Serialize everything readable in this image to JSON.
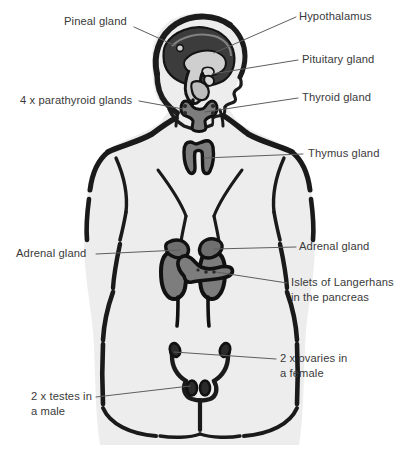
{
  "diagram": {
    "figure_description": "Grey silhouette of a human torso seen from behind with the head in right-facing profile; endocrine glands are drawn in mid-grey with heavy black outlines and connected to labels by thin leader lines.",
    "colors": {
      "background": "#ffffff",
      "body_fill": "#ededed",
      "body_outline": "#1a1a1a",
      "organ_fill": "#7d7d7d",
      "organ_outline": "#111111",
      "brain_fill": "#3c3c3c",
      "skull_outline": "#1c1c1c",
      "label_text": "#3a3a3a",
      "leader_line": "#5e5e5e"
    },
    "labels": [
      {
        "id": "pineal-gland",
        "text": "Pineal gland",
        "side": "left",
        "x": 64,
        "y": 19,
        "align": "left",
        "leader": [
          [
            134,
            27
          ],
          [
            176,
            44
          ]
        ]
      },
      {
        "id": "hypothalamus",
        "text": "Hypothalamus",
        "side": "right",
        "x": 300,
        "y": 9,
        "align": "left",
        "leader": [
          [
            296,
            17
          ],
          [
            215,
            52
          ]
        ]
      },
      {
        "id": "pituitary-gland",
        "text": "Pituitary gland",
        "side": "right",
        "x": 303,
        "y": 53,
        "align": "left",
        "leader": [
          [
            298,
            60
          ],
          [
            213,
            73
          ]
        ]
      },
      {
        "id": "thyroid-gland",
        "text": "Thyroid gland",
        "side": "right",
        "x": 303,
        "y": 91,
        "align": "left",
        "leader": [
          [
            298,
            98
          ],
          [
            202,
            114
          ]
        ]
      },
      {
        "id": "parathyroid-glands",
        "text": "4 x parathyroid glands",
        "side": "left",
        "x": 21,
        "y": 94,
        "align": "left",
        "leader": [
          [
            139,
            101
          ],
          [
            184,
            110
          ]
        ]
      },
      {
        "id": "thymus-gland",
        "text": "Thymus gland",
        "side": "right",
        "x": 308,
        "y": 147,
        "align": "left",
        "leader": [
          [
            303,
            154
          ],
          [
            200,
            157
          ]
        ]
      },
      {
        "id": "adrenal-gland-left",
        "text": "Adrenal gland",
        "side": "left",
        "x": 17,
        "y": 247,
        "align": "left",
        "leader": [
          [
            96,
            254
          ],
          [
            180,
            262
          ]
        ]
      },
      {
        "id": "adrenal-gland-right",
        "text": "Adrenal gland",
        "side": "right",
        "x": 300,
        "y": 240,
        "align": "left",
        "leader": [
          [
            296,
            247
          ],
          [
            215,
            250
          ]
        ]
      },
      {
        "id": "islets-of-langerhans",
        "text": "Islets of Langerhans\nin the pancreas",
        "side": "right",
        "x": 291,
        "y": 276,
        "align": "left",
        "leader": [
          [
            287,
            283
          ],
          [
            215,
            272
          ]
        ]
      },
      {
        "id": "ovaries",
        "text": "2 x ovaries in\na female",
        "side": "right",
        "x": 280,
        "y": 352,
        "align": "left",
        "leader": [
          [
            276,
            359
          ],
          [
            172,
            354
          ]
        ]
      },
      {
        "id": "testes",
        "text": "2 x testes in\na male",
        "side": "left",
        "x": 32,
        "y": 390,
        "align": "left",
        "leader": [
          [
            96,
            397
          ],
          [
            186,
            386
          ]
        ]
      }
    ],
    "glands": [
      {
        "id": "brain",
        "name": "brain",
        "described_as": "dark grey cerebrum and brain stem inside the skull outline"
      },
      {
        "id": "pineal",
        "name": "pineal gland",
        "described_as": "small structure deep in the brain, upper-left of the brain stem"
      },
      {
        "id": "hypothalamus",
        "name": "hypothalamus",
        "described_as": "central brain structure above the pituitary"
      },
      {
        "id": "pituitary",
        "name": "pituitary gland",
        "described_as": "small pendant gland at the base of the brain"
      },
      {
        "id": "thyroid",
        "name": "thyroid gland",
        "described_as": "butterfly / H-shaped gland in the neck"
      },
      {
        "id": "parathyroid",
        "name": "4 x parathyroid glands",
        "described_as": "four small nodules on the back of the thyroid lobes"
      },
      {
        "id": "thymus",
        "name": "thymus gland",
        "described_as": "two-lobed gland in the upper chest behind the sternum"
      },
      {
        "id": "adrenal-left",
        "name": "adrenal gland (left)",
        "described_as": "cap sitting on top of the viewer-left kidney"
      },
      {
        "id": "adrenal-right",
        "name": "adrenal gland (right)",
        "described_as": "cap sitting on top of the viewer-right kidney"
      },
      {
        "id": "pancreas",
        "name": "islets of Langerhans in the pancreas",
        "described_as": "elongated organ crossing horizontally in front of the kidneys"
      },
      {
        "id": "ovaries",
        "name": "2 x ovaries in a female",
        "described_as": "two small oval bodies at the ends of the fallopian tubes"
      },
      {
        "id": "testes",
        "name": "2 x testes in a male",
        "described_as": "two small oval bodies at the base of the reproductive tract"
      },
      {
        "id": "kidneys",
        "name": "kidneys",
        "described_as": "two bean-shaped organs with ureters, shown for context"
      }
    ]
  }
}
